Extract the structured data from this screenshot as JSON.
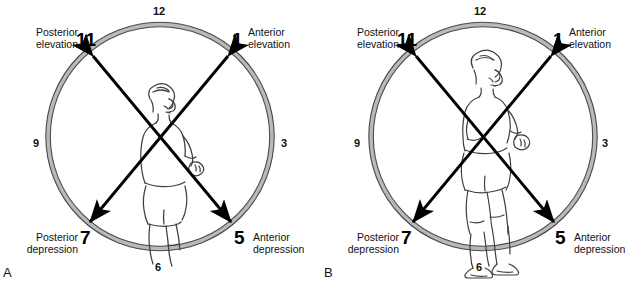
{
  "figure": {
    "type": "anatomical-clock-diagram",
    "panel_count": 2,
    "colors": {
      "ink": "#000000",
      "ring_fill": "#d9d9d9",
      "background": "#ffffff",
      "body_outline": "#3a3a3a"
    }
  },
  "panels": [
    {
      "letter": "A",
      "view": "oblique / three-quarter view of subject from behind-right",
      "figure_description": "line drawing of a person seen from the side, torso and thigh visible, right arm flexed at the elbow, head turned to the right",
      "clock": {
        "hours": {
          "twelve": "12",
          "three": "3",
          "six": "6",
          "nine": "9",
          "one": "1",
          "five": "5",
          "seven": "7",
          "eleven": "11"
        },
        "labels": {
          "posterior_elevation_line1": "Posterior",
          "posterior_elevation_line2": "elevation",
          "anterior_elevation_line1": "Anterior",
          "anterior_elevation_line2": "elevation",
          "posterior_depression_line1": "Posterior",
          "posterior_depression_line2": "depression",
          "anterior_depression_line1": "Anterior",
          "anterior_depression_line2": "depression"
        },
        "arrows": [
          {
            "name": "posterior-elevation-anterior-depression-axis",
            "from_hour": "11",
            "to_hour": "5",
            "double_headed": true,
            "meaning": "Posterior elevation ↔ Anterior depression"
          },
          {
            "name": "anterior-elevation-posterior-depression-axis",
            "from_hour": "1",
            "to_hour": "7",
            "double_headed": true,
            "meaning": "Anterior elevation ↔ Posterior depression"
          }
        ]
      }
    },
    {
      "letter": "B",
      "view": "lateral / sagittal view of the whole standing subject",
      "figure_description": "full-body line drawing of a person standing in side view, arms flexed forward, bare feet, head facing right",
      "clock": {
        "hours": {
          "twelve": "12",
          "three": "3",
          "six": "6",
          "nine": "9",
          "one": "1",
          "five": "5",
          "seven": "7",
          "eleven": "11"
        },
        "labels": {
          "posterior_elevation_line1": "Posterior",
          "posterior_elevation_line2": "elevation",
          "anterior_elevation_line1": "Anterior",
          "anterior_elevation_line2": "elevation",
          "posterior_depression_line1": "Posterior",
          "posterior_depression_line2": "depression",
          "anterior_depression_line1": "Anterior",
          "anterior_depression_line2": "depression"
        },
        "arrows": [
          {
            "name": "posterior-elevation-anterior-depression-axis",
            "from_hour": "11",
            "to_hour": "5",
            "double_headed": true,
            "meaning": "Posterior elevation ↔ Anterior depression"
          },
          {
            "name": "anterior-elevation-posterior-depression-axis",
            "from_hour": "1",
            "to_hour": "7",
            "double_headed": true,
            "meaning": "Anterior elevation ↔ Posterior depression"
          }
        ]
      }
    }
  ]
}
